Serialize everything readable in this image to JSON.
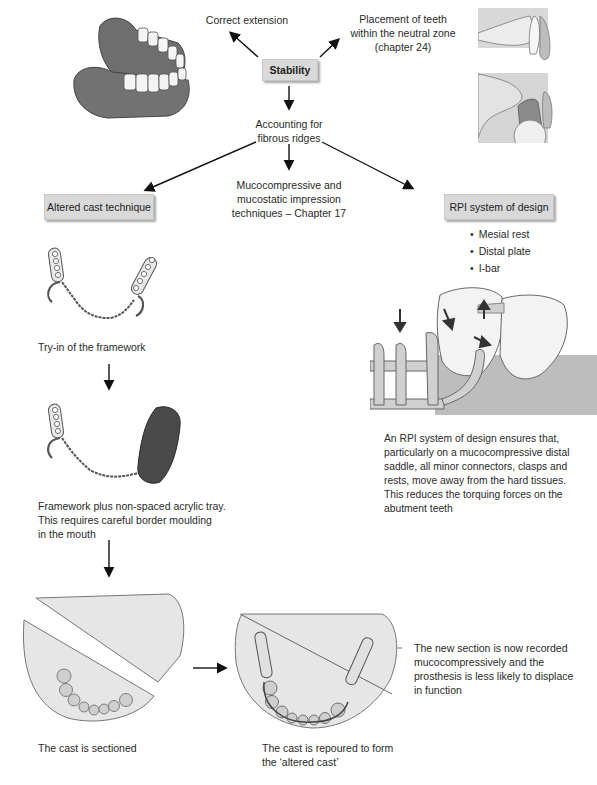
{
  "diagram": {
    "central_node": {
      "label": "Stability"
    },
    "top_left_label": "Correct extension",
    "top_right_label": [
      "Placement of teeth",
      "within the neutral zone",
      "(chapter 24)"
    ],
    "middle_label": [
      "Accounting for",
      "fibrous ridges"
    ],
    "center_branch_label": [
      "Mucocompressive and",
      "mucostatic impression",
      "techniques – Chapter 17"
    ],
    "left_branch": {
      "label": "Altered cast technique",
      "steps": [
        {
          "caption": "Try-in of the framework"
        },
        {
          "caption": [
            "Framework plus non-spaced acrylic tray.",
            "This requires careful border moulding",
            "in the mouth"
          ]
        },
        {
          "caption": "The cast is sectioned"
        },
        {
          "caption": [
            "The cast is repoured to form",
            "the ‘altered cast’"
          ]
        }
      ],
      "annotation": [
        "The new section is now recorded",
        "mucocompressively and the",
        "prosthesis is less likely to displace",
        "in function"
      ]
    },
    "right_branch": {
      "label": "RPI system of design",
      "bullets": [
        "Mesial rest",
        "Distal plate",
        "I-bar"
      ],
      "description": [
        "An RPI system of design ensures that,",
        "particularly on a mucocompressive distal",
        "saddle, all minor connectors, clasps and",
        "rests, move away from the hard tissues.",
        "This reduces the torquing forces on the",
        "abutment teeth"
      ]
    }
  },
  "colors": {
    "box_fill": "#d9d9d9",
    "gum": "#6e6e6e",
    "cast": "#e6e6e6",
    "tray": "#4a4a4a",
    "arrow": "#111111"
  }
}
